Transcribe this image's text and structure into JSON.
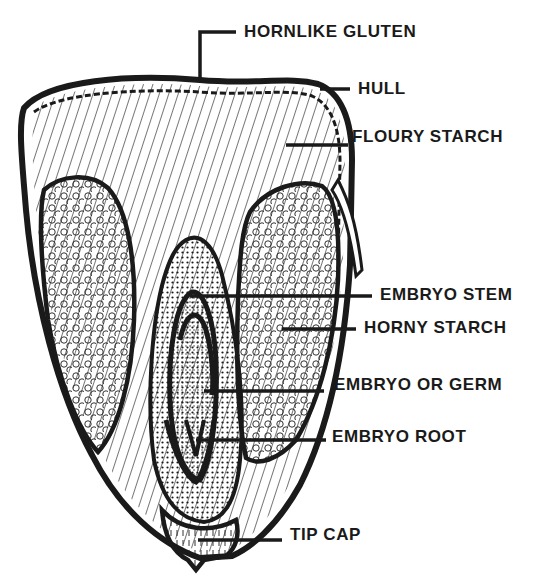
{
  "diagram": {
    "ink_color": "#1a1a1a",
    "background": "#ffffff",
    "labels": [
      {
        "id": "hornlike-gluten",
        "text": "HORNLIKE GLUTEN",
        "x": 244,
        "y": 23
      },
      {
        "id": "hull",
        "text": "HULL",
        "x": 358,
        "y": 80
      },
      {
        "id": "floury-starch",
        "text": "FLOURY STARCH",
        "x": 352,
        "y": 128
      },
      {
        "id": "embryo-stem",
        "text": "EMBRYO STEM",
        "x": 380,
        "y": 285
      },
      {
        "id": "horny-starch",
        "text": "HORNY STARCH",
        "x": 364,
        "y": 318
      },
      {
        "id": "embryo-or-germ",
        "text": "EMBRYO OR GERM",
        "x": 334,
        "y": 375
      },
      {
        "id": "embryo-root",
        "text": "EMBRYO ROOT",
        "x": 332,
        "y": 427
      },
      {
        "id": "tip-cap",
        "text": "TIP CAP",
        "x": 290,
        "y": 525
      }
    ]
  }
}
